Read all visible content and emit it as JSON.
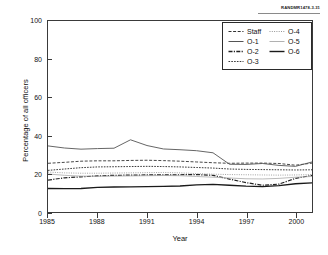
{
  "figure": {
    "source_credit": "RANDMR1478-3.31"
  },
  "chart_data": {
    "type": "line",
    "title": "",
    "xlabel": "Year",
    "ylabel": "Percentage of all officers",
    "xlim": [
      1985,
      2001
    ],
    "ylim": [
      0,
      100
    ],
    "xticks": [
      1985,
      1988,
      1991,
      1994,
      1997,
      2000
    ],
    "yticks": [
      0,
      20,
      40,
      60,
      80,
      100
    ],
    "xtick_labels": [
      "1985",
      "1988",
      "1991",
      "1994",
      "1997",
      "2000"
    ],
    "ytick_labels": [
      "0",
      "20",
      "40",
      "60",
      "80",
      "100"
    ],
    "grid": false,
    "legend_position": "top-right",
    "x": [
      1985,
      1986,
      1987,
      1988,
      1989,
      1990,
      1991,
      1992,
      1993,
      1994,
      1995,
      1996,
      1997,
      1998,
      1999,
      2000,
      2001
    ],
    "series": [
      {
        "name": "Staff",
        "style": "dashed",
        "color": "#333333",
        "values": [
          25.5,
          26.0,
          26.6,
          26.8,
          26.8,
          27.0,
          27.1,
          26.9,
          26.6,
          26.2,
          25.8,
          25.5,
          25.6,
          25.6,
          25.4,
          24.5,
          25.6
        ]
      },
      {
        "name": "O-1",
        "style": "solid",
        "color": "#555555",
        "values": [
          34.6,
          33.5,
          32.9,
          33.2,
          33.4,
          37.8,
          34.8,
          33.0,
          32.6,
          32.1,
          31.0,
          25.0,
          24.9,
          25.4,
          24.4,
          23.9,
          26.2
        ]
      },
      {
        "name": "O-2",
        "style": "dashdot",
        "color": "#222222",
        "values": [
          16.7,
          17.9,
          18.4,
          18.9,
          19.2,
          19.3,
          19.4,
          19.4,
          19.5,
          19.6,
          19.2,
          17.2,
          15.4,
          14.0,
          14.6,
          17.6,
          19.2
        ]
      },
      {
        "name": "O-3",
        "style": "dotted",
        "color": "#3a3a3a",
        "values": [
          21.8,
          22.5,
          23.2,
          23.6,
          23.7,
          23.8,
          23.9,
          23.8,
          23.6,
          23.3,
          23.0,
          22.5,
          22.3,
          22.2,
          22.1,
          22.0,
          22.1
        ]
      },
      {
        "name": "O-4",
        "style": "finedot",
        "color": "#8a8a8a",
        "values": [
          20.9,
          20.5,
          20.3,
          20.3,
          20.4,
          20.5,
          20.6,
          20.7,
          20.5,
          20.1,
          19.8,
          19.6,
          19.5,
          19.4,
          19.3,
          19.4,
          19.6
        ]
      },
      {
        "name": "O-5",
        "style": "solid-light",
        "color": "#a8a8a8",
        "values": [
          19.9,
          19.2,
          18.8,
          18.7,
          18.8,
          18.9,
          19.0,
          19.1,
          19.0,
          18.6,
          18.2,
          17.8,
          17.4,
          17.3,
          17.6,
          18.2,
          18.6
        ]
      },
      {
        "name": "O-6",
        "style": "solid-heavy",
        "color": "#1a1a1a",
        "values": [
          12.3,
          12.2,
          12.3,
          12.9,
          13.1,
          13.2,
          13.3,
          13.4,
          13.6,
          14.2,
          14.5,
          14.0,
          13.5,
          13.3,
          13.8,
          14.8,
          15.2
        ]
      }
    ]
  },
  "legend": {
    "entries": [
      {
        "label": "Staff",
        "style": "dashed"
      },
      {
        "label": "O-4",
        "style": "finedot"
      },
      {
        "label": "O-1",
        "style": "solid"
      },
      {
        "label": "O-5",
        "style": "solid-light"
      },
      {
        "label": "O-2",
        "style": "dashdot"
      },
      {
        "label": "O-6",
        "style": "solid-heavy"
      },
      {
        "label": "O-3",
        "style": "dotted"
      }
    ]
  }
}
